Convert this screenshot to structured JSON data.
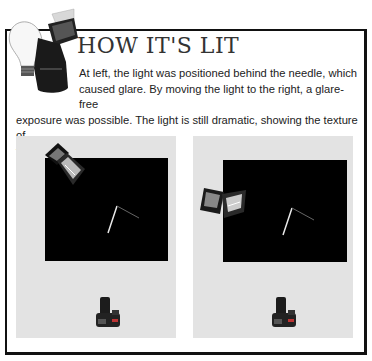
{
  "header": {
    "icon": "flash-lightbulb-icon",
    "title": "HOW IT'S LIT"
  },
  "body": {
    "line1": "At left, the light was positioned behind the needle, which",
    "line2": "caused glare. By moving the light to the right, a glare-free",
    "line3": "exposure was possible.  The light is still dramatic, showing the texture of",
    "line4": "the needle and thread."
  },
  "panels": [
    {
      "name": "light-behind-needle",
      "light_position": "upper-left, behind needle",
      "background_color": "#000000",
      "surround_color": "#e3e3e3",
      "elements": [
        "softbox-light-icon",
        "needle-and-thread",
        "camera-icon"
      ]
    },
    {
      "name": "light-moved-right",
      "light_position": "left-middle side",
      "background_color": "#000000",
      "surround_color": "#e3e3e3",
      "elements": [
        "softbox-light-icon",
        "needle-and-thread",
        "camera-icon"
      ]
    }
  ],
  "colors": {
    "border": "#111111",
    "panel": "#e3e3e3",
    "backdrop": "#000000",
    "text": "#222222"
  }
}
